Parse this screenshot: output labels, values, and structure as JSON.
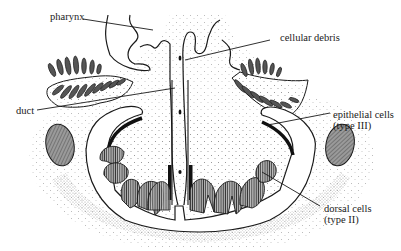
{
  "diagram": {
    "type": "anatomical cross-section",
    "colors": {
      "ink": "#1a1a1a",
      "stipple": "#6b6b6b",
      "background": "#ffffff"
    }
  },
  "labels": [
    {
      "id": "pharynx",
      "text": "pharynx"
    },
    {
      "id": "cellular_debris",
      "text": "cellular debris"
    },
    {
      "id": "duct",
      "text": "duct"
    },
    {
      "id": "epithelial_cells",
      "text": "epithelial cells",
      "subtext": "(type III)"
    },
    {
      "id": "dorsal_cells",
      "text": "dorsal cells",
      "subtext": "(type II)"
    }
  ]
}
